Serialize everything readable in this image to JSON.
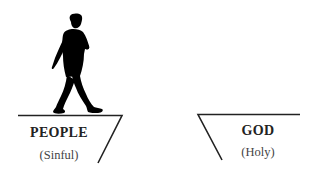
{
  "left_cliff": {
    "title": "PEOPLE",
    "subtitle": "(Sinful)"
  },
  "right_cliff": {
    "title": "GOD",
    "subtitle": "(Holy)"
  },
  "figure": {
    "icon": "walking-man-silhouette",
    "color": "#000000"
  },
  "line_color": "#222222"
}
